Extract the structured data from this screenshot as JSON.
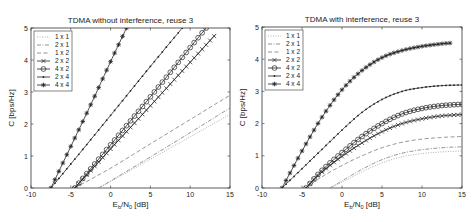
{
  "chart_data": [
    {
      "type": "line",
      "title": "TDMA without interference, reuse 3",
      "xlabel": "E_b/N_0 [dB]",
      "ylabel": "C [bps/Hz]",
      "xlim": [
        -10,
        15
      ],
      "ylim": [
        0,
        5
      ],
      "xticks": [
        -10,
        -5,
        0,
        5,
        10,
        15
      ],
      "yticks": [
        0,
        1,
        2,
        3,
        4,
        5
      ],
      "grid": false,
      "legend_position": "upper left",
      "series": [
        {
          "name": "1 x 1",
          "style": "dotted",
          "marker": "none",
          "x": [
            -1.5,
            0,
            5,
            10,
            15
          ],
          "y": [
            0,
            0.2,
            0.9,
            1.6,
            2.3
          ]
        },
        {
          "name": "2 x 1",
          "style": "dashdot",
          "marker": "none",
          "x": [
            -1.5,
            0,
            5,
            10,
            15
          ],
          "y": [
            0,
            0.22,
            0.97,
            1.73,
            2.5
          ]
        },
        {
          "name": "1 x 2",
          "style": "dashed",
          "marker": "none",
          "x": [
            -4.5,
            0,
            5,
            10,
            15
          ],
          "y": [
            0,
            0.62,
            1.38,
            2.14,
            2.9
          ]
        },
        {
          "name": "2 x 2",
          "style": "solid",
          "marker": "x",
          "x": [
            -4.5,
            0,
            5,
            10,
            13.2
          ],
          "y": [
            0,
            1.22,
            2.57,
            3.93,
            4.8
          ]
        },
        {
          "name": "4 x 2",
          "style": "solid",
          "marker": "o",
          "x": [
            -4.5,
            0,
            5,
            10,
            12
          ],
          "y": [
            0,
            1.35,
            2.85,
            4.39,
            5.0
          ]
        },
        {
          "name": "2 x 4",
          "style": "solid",
          "marker": ".",
          "x": [
            -7.5,
            -5,
            0,
            5,
            9
          ],
          "y": [
            0,
            0.75,
            2.27,
            3.8,
            5.0
          ]
        },
        {
          "name": "4 x 4",
          "style": "solid",
          "marker": "*",
          "x": [
            -7.5,
            -5,
            -2.5,
            0,
            2
          ],
          "y": [
            0,
            1.3,
            2.6,
            3.95,
            5.0
          ]
        }
      ]
    },
    {
      "type": "line",
      "title": "TDMA with interference, reuse 3",
      "xlabel": "E_b/N_0 [dB]",
      "ylabel": "C [bps/Hz]",
      "xlim": [
        -10,
        15
      ],
      "ylim": [
        0,
        5
      ],
      "xticks": [
        -10,
        -5,
        0,
        5,
        10,
        15
      ],
      "yticks": [
        0,
        1,
        2,
        3,
        4,
        5
      ],
      "grid": false,
      "legend_position": "upper left",
      "series": [
        {
          "name": "1 x 1",
          "style": "dotted",
          "marker": "none",
          "x": [
            -1.5,
            0,
            2.5,
            5,
            7.5,
            10,
            12.5,
            15
          ],
          "y": [
            0,
            0.18,
            0.5,
            0.78,
            0.97,
            1.07,
            1.12,
            1.15
          ]
        },
        {
          "name": "2 x 1",
          "style": "dashdot",
          "marker": "none",
          "x": [
            -1.5,
            0,
            2.5,
            5,
            7.5,
            10,
            12.5,
            15
          ],
          "y": [
            0,
            0.22,
            0.58,
            0.88,
            1.08,
            1.19,
            1.25,
            1.28
          ]
        },
        {
          "name": "1 x 2",
          "style": "dashed",
          "marker": "none",
          "x": [
            -4.5,
            -2.5,
            0,
            2.5,
            5,
            7.5,
            10,
            12.5,
            15
          ],
          "y": [
            0,
            0.35,
            0.7,
            1.0,
            1.25,
            1.42,
            1.52,
            1.57,
            1.6
          ]
        },
        {
          "name": "2 x 2",
          "style": "solid",
          "marker": "x",
          "x": [
            -4.5,
            -2.5,
            0,
            2.5,
            5,
            7.5,
            10,
            12.5,
            15
          ],
          "y": [
            0,
            0.5,
            0.98,
            1.4,
            1.75,
            2.0,
            2.15,
            2.24,
            2.28
          ]
        },
        {
          "name": "4 x 2",
          "style": "solid",
          "marker": "o",
          "x": [
            -4.5,
            -2.5,
            0,
            2.5,
            5,
            7.5,
            10,
            12.5,
            15
          ],
          "y": [
            0,
            0.55,
            1.1,
            1.6,
            2.0,
            2.3,
            2.47,
            2.56,
            2.6
          ]
        },
        {
          "name": "2 x 4",
          "style": "solid",
          "marker": ".",
          "x": [
            -7.5,
            -5,
            -2.5,
            0,
            2.5,
            5,
            7.5,
            10,
            12.5,
            15
          ],
          "y": [
            0,
            0.6,
            1.2,
            1.8,
            2.35,
            2.75,
            3.0,
            3.12,
            3.18,
            3.2
          ]
        },
        {
          "name": "4 x 4",
          "style": "solid",
          "marker": "*",
          "x": [
            -7.5,
            -5,
            -2.5,
            0,
            2.5,
            5,
            7.5,
            10,
            12.5,
            13.5
          ],
          "y": [
            0,
            1.15,
            2.2,
            3.05,
            3.65,
            4.05,
            4.27,
            4.4,
            4.48,
            4.5
          ]
        }
      ]
    }
  ]
}
